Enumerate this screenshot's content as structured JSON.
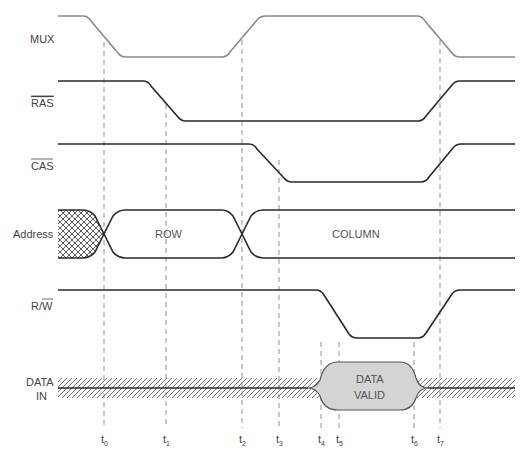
{
  "diagram": {
    "type": "DRAM write timing diagram",
    "signals": [
      {
        "name": "MUX",
        "overbar": false
      },
      {
        "name": "RAS",
        "overbar": true
      },
      {
        "name": "CAS",
        "overbar": true
      },
      {
        "name": "Address",
        "overbar": false
      },
      {
        "name": "R/W",
        "overbar_part": "W"
      },
      {
        "name": "DATA IN",
        "overbar": false
      }
    ],
    "labels": {
      "mux": "MUX",
      "ras": "RAS",
      "cas": "CAS",
      "address": "Address",
      "rw_r": "R/",
      "rw_w": "W",
      "data_in_line1": "DATA",
      "data_in_line2": "IN"
    },
    "bus_values": {
      "row": "ROW",
      "column": "COLUMN",
      "data_valid_line1": "DATA",
      "data_valid_line2": "VALID"
    },
    "time_markers": [
      {
        "base": "t",
        "sub": "0"
      },
      {
        "base": "t",
        "sub": "1"
      },
      {
        "base": "t",
        "sub": "2"
      },
      {
        "base": "t",
        "sub": "3"
      },
      {
        "base": "t",
        "sub": "4"
      },
      {
        "base": "t",
        "sub": "5"
      },
      {
        "base": "t",
        "sub": "6"
      },
      {
        "base": "t",
        "sub": "7"
      }
    ],
    "colors": {
      "mux_line": "#8a8a8a",
      "signal_line": "#2a2a2a",
      "dashed": "#777777",
      "data_valid_fill": "#d4d4d4",
      "hatch": "#555555"
    }
  }
}
